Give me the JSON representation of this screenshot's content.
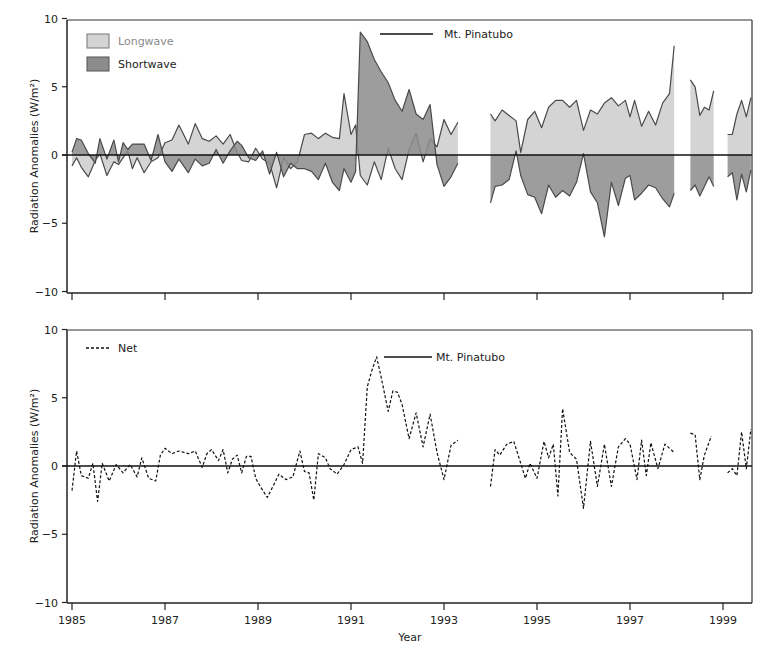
{
  "chart_data": [
    {
      "type": "area",
      "panel": "top",
      "title": "",
      "xlabel": "",
      "ylabel": "Radiation Anomalies (W/m²)",
      "ylim": [
        -10,
        10
      ],
      "yticks": [
        -10,
        -5,
        0,
        5,
        10
      ],
      "ytick_labels": [
        "−10",
        "−5",
        "0",
        "5",
        "10"
      ],
      "xlim": [
        1985,
        1999.7
      ],
      "xticks": [
        1985,
        1987,
        1989,
        1991,
        1993,
        1995,
        1997,
        1999
      ],
      "grid": false,
      "legend_position": "upper-left",
      "legend": [
        {
          "label": "Longwave",
          "color": "#d4d4d4"
        },
        {
          "label": "Shortwave",
          "color": "#8c8c8c"
        }
      ],
      "annotations": [
        {
          "text": "Mt. Pinatubo",
          "x": 1991.7,
          "y": 9.0
        }
      ],
      "series": [
        {
          "name": "Longwave",
          "color": "#d4d4d4",
          "segments": [
            {
              "x": [
                1985.0,
                1985.1,
                1985.2,
                1985.35,
                1985.5,
                1985.6,
                1985.75,
                1985.9,
                1986.0,
                1986.1,
                1986.2,
                1986.3,
                1986.4,
                1986.55,
                1986.7,
                1986.85,
                1987.0,
                1987.15,
                1987.3,
                1987.5,
                1987.65,
                1987.8,
                1987.95,
                1988.1,
                1988.25,
                1988.4,
                1988.55,
                1988.65,
                1988.8,
                1988.95,
                1989.1,
                1989.25,
                1989.4,
                1989.55,
                1989.7,
                1989.85,
                1990.0,
                1990.15,
                1990.3,
                1990.45,
                1990.6,
                1990.75,
                1990.85,
                1991.0,
                1991.1,
                1991.2,
                1991.35,
                1991.5,
                1991.65,
                1991.8,
                1991.95,
                1992.1,
                1992.25,
                1992.4,
                1992.55,
                1992.7,
                1992.85,
                1993.0,
                1993.15,
                1993.3
              ],
              "y": [
                -0.8,
                -0.2,
                -0.9,
                -1.6,
                -0.4,
                0.1,
                -1.5,
                -0.5,
                -0.7,
                -0.2,
                0.3,
                -1.0,
                -0.2,
                -1.3,
                -0.5,
                -0.2,
                0.9,
                1.1,
                2.2,
                0.8,
                2.3,
                1.2,
                1.0,
                1.4,
                0.8,
                1.5,
                0.2,
                -0.4,
                -0.5,
                0.5,
                -0.3,
                -0.6,
                -2.4,
                -0.2,
                -1.0,
                -0.5,
                1.5,
                1.6,
                1.2,
                1.6,
                1.3,
                1.2,
                4.5,
                1.5,
                2.2,
                -1.5,
                -2.2,
                -0.5,
                -1.8,
                0.5,
                -1.0,
                -1.8,
                0.4,
                1.6,
                -0.5,
                1.2,
                0.6,
                2.6,
                1.5,
                2.4
              ]
            },
            {
              "x": [
                1994.0,
                1994.1,
                1994.25,
                1994.4,
                1994.55,
                1994.65,
                1994.8,
                1994.95,
                1995.1,
                1995.25,
                1995.4,
                1995.55,
                1995.7,
                1995.85,
                1996.0,
                1996.15,
                1996.3,
                1996.45,
                1996.6,
                1996.75,
                1996.9,
                1997.0,
                1997.1,
                1997.25,
                1997.4,
                1997.55,
                1997.7,
                1997.85,
                1997.95
              ],
              "y": [
                3.0,
                2.5,
                3.3,
                2.9,
                2.5,
                0.2,
                2.6,
                3.2,
                2.0,
                3.5,
                4.0,
                4.0,
                3.5,
                4.0,
                1.8,
                3.3,
                3.0,
                3.8,
                4.2,
                3.6,
                4.0,
                2.8,
                4.0,
                2.1,
                3.2,
                2.2,
                3.8,
                4.5,
                8.0
              ]
            },
            {
              "x": [
                1998.3,
                1998.4,
                1998.5,
                1998.6,
                1998.7,
                1998.8
              ],
              "y": [
                5.5,
                5.0,
                2.9,
                3.5,
                3.3,
                4.7
              ]
            },
            {
              "x": [
                1999.1,
                1999.2,
                1999.3,
                1999.4,
                1999.5,
                1999.6
              ],
              "y": [
                1.5,
                1.5,
                3.0,
                4.0,
                2.8,
                4.2
              ]
            }
          ]
        },
        {
          "name": "Shortwave",
          "color": "#8c8c8c",
          "segments": [
            {
              "x": [
                1985.0,
                1985.1,
                1985.2,
                1985.35,
                1985.5,
                1985.6,
                1985.75,
                1985.9,
                1986.0,
                1986.1,
                1986.2,
                1986.3,
                1986.4,
                1986.55,
                1986.7,
                1986.85,
                1987.0,
                1987.15,
                1987.3,
                1987.5,
                1987.65,
                1987.8,
                1987.95,
                1988.1,
                1988.25,
                1988.4,
                1988.55,
                1988.65,
                1988.8,
                1988.95,
                1989.1,
                1989.25,
                1989.4,
                1989.55,
                1989.7,
                1989.85,
                1990.0,
                1990.15,
                1990.3,
                1990.45,
                1990.6,
                1990.75,
                1990.85,
                1991.0,
                1991.1,
                1991.2,
                1991.35,
                1991.5,
                1991.65,
                1991.8,
                1991.95,
                1992.1,
                1992.25,
                1992.4,
                1992.55,
                1992.7,
                1992.85,
                1993.0,
                1993.15,
                1993.3
              ],
              "y": [
                0.2,
                1.2,
                1.1,
                0.1,
                -0.6,
                1.2,
                -0.3,
                1.1,
                -0.5,
                0.9,
                0.4,
                0.8,
                0.8,
                0.8,
                -0.4,
                1.5,
                -0.5,
                -1.2,
                -0.3,
                -1.3,
                -0.3,
                -0.8,
                -0.6,
                0.4,
                -0.6,
                0.3,
                1.0,
                0.7,
                -0.2,
                -0.4,
                0.3,
                -1.4,
                0.2,
                -1.6,
                -0.6,
                -1.0,
                -1.0,
                -1.2,
                -1.8,
                -0.6,
                -2.0,
                -2.6,
                -1.0,
                -2.0,
                -1.2,
                9.0,
                8.3,
                7.0,
                6.1,
                5.3,
                4.0,
                3.2,
                4.8,
                3.0,
                2.6,
                3.7,
                -0.7,
                -2.3,
                -1.6,
                -0.6
              ]
            },
            {
              "x": [
                1994.0,
                1994.1,
                1994.25,
                1994.4,
                1994.55,
                1994.65,
                1994.8,
                1994.95,
                1995.1,
                1995.25,
                1995.4,
                1995.55,
                1995.7,
                1995.85,
                1996.0,
                1996.15,
                1996.3,
                1996.45,
                1996.6,
                1996.75,
                1996.9,
                1997.0,
                1997.1,
                1997.25,
                1997.4,
                1997.55,
                1997.7,
                1997.85,
                1997.95
              ],
              "y": [
                -3.5,
                -2.3,
                -2.2,
                -1.8,
                0.3,
                -1.5,
                -2.9,
                -3.1,
                -4.3,
                -2.2,
                -3.1,
                -2.6,
                -3.0,
                -2.0,
                0.1,
                -2.7,
                -3.5,
                -6.0,
                -2.0,
                -3.7,
                -1.7,
                -1.5,
                -3.3,
                -2.8,
                -2.2,
                -2.4,
                -3.2,
                -3.8,
                -2.8
              ]
            },
            {
              "x": [
                1998.3,
                1998.4,
                1998.5,
                1998.6,
                1998.7,
                1998.8
              ],
              "y": [
                -2.6,
                -2.2,
                -3.0,
                -2.3,
                -1.6,
                -2.3
              ]
            },
            {
              "x": [
                1999.1,
                1999.2,
                1999.3,
                1999.4,
                1999.5,
                1999.6
              ],
              "y": [
                -1.6,
                -1.3,
                -3.3,
                -1.4,
                -2.7,
                -1.1
              ]
            }
          ]
        }
      ]
    },
    {
      "type": "line",
      "panel": "bottom",
      "title": "",
      "xlabel": "Year",
      "ylabel": "Radiation Anomalies (W/m²)",
      "ylim": [
        -10,
        10
      ],
      "yticks": [
        -10,
        -5,
        0,
        5,
        10
      ],
      "ytick_labels": [
        "−10",
        "−5",
        "0",
        "5",
        "10"
      ],
      "xlim": [
        1985,
        1999.7
      ],
      "xticks": [
        1985,
        1987,
        1989,
        1991,
        1993,
        1995,
        1997,
        1999
      ],
      "xtick_labels": [
        "1985",
        "1987",
        "1989",
        "1991",
        "1993",
        "1995",
        "1997",
        "1999"
      ],
      "grid": false,
      "legend_position": "upper-left",
      "legend": [
        {
          "label": "Net",
          "style": "dashed",
          "color": "#111111"
        }
      ],
      "annotations": [
        {
          "text": "Mt. Pinatubo",
          "x": 1991.7,
          "y": 8.0
        }
      ],
      "series": [
        {
          "name": "Net",
          "style": "dashed",
          "segments": [
            {
              "x": [
                1985.0,
                1985.1,
                1985.2,
                1985.35,
                1985.45,
                1985.55,
                1985.65,
                1985.8,
                1985.95,
                1986.1,
                1986.25,
                1986.4,
                1986.5,
                1986.65,
                1986.8,
                1986.9,
                1987.0,
                1987.15,
                1987.3,
                1987.5,
                1987.65,
                1987.8,
                1987.9,
                1988.0,
                1988.15,
                1988.25,
                1988.35,
                1988.45,
                1988.55,
                1988.65,
                1988.75,
                1988.85,
                1988.95,
                1989.05,
                1989.2,
                1989.35,
                1989.45,
                1989.6,
                1989.75,
                1989.9,
                1990.0,
                1990.1,
                1990.2,
                1990.3,
                1990.45,
                1990.55,
                1990.7,
                1990.85,
                1991.0,
                1991.15,
                1991.25,
                1991.35,
                1991.45,
                1991.55,
                1991.65,
                1991.8,
                1991.9,
                1992.0,
                1992.1,
                1992.25,
                1992.4,
                1992.55,
                1992.7,
                1992.85,
                1993.0,
                1993.15,
                1993.3
              ],
              "y": [
                -1.8,
                1.1,
                -0.7,
                -0.9,
                0.2,
                -2.6,
                0.2,
                -1.1,
                0.1,
                -0.5,
                0.1,
                -0.8,
                0.6,
                -0.9,
                -1.1,
                0.8,
                1.3,
                0.9,
                1.1,
                0.9,
                1.1,
                -0.1,
                0.9,
                1.2,
                0.4,
                1.2,
                -0.5,
                0.5,
                0.8,
                -0.5,
                0.7,
                0.7,
                -0.9,
                -1.5,
                -2.3,
                -1.3,
                -0.6,
                -1.0,
                -0.8,
                1.1,
                -0.4,
                -0.5,
                -2.5,
                0.9,
                0.6,
                -0.2,
                -0.6,
                0.1,
                1.2,
                1.4,
                0.2,
                5.8,
                7.0,
                8.0,
                6.5,
                4.0,
                5.5,
                5.4,
                4.5,
                2.0,
                3.9,
                1.4,
                3.8,
                1.0,
                -1.0,
                1.5,
                1.9
              ]
            },
            {
              "x": [
                1994.0,
                1994.1,
                1994.2,
                1994.35,
                1994.5,
                1994.65,
                1994.75,
                1994.85,
                1995.0,
                1995.15,
                1995.25,
                1995.35,
                1995.45,
                1995.55,
                1995.7,
                1995.85,
                1996.0,
                1996.15,
                1996.3,
                1996.45,
                1996.6,
                1996.75,
                1996.9,
                1997.0,
                1997.15,
                1997.25,
                1997.35,
                1997.45,
                1997.6,
                1997.75,
                1997.95
              ],
              "y": [
                -1.5,
                1.2,
                0.8,
                1.6,
                1.8,
                0.2,
                -0.9,
                0.2,
                -0.9,
                1.8,
                0.6,
                1.6,
                -2.2,
                4.2,
                1.0,
                0.5,
                -3.1,
                1.8,
                -1.5,
                1.6,
                -1.5,
                1.4,
                2.0,
                1.6,
                -1.0,
                1.9,
                -0.7,
                1.7,
                -0.2,
                1.6,
                1.0
              ]
            },
            {
              "x": [
                1998.3,
                1998.4,
                1998.5,
                1998.6,
                1998.75
              ],
              "y": [
                2.4,
                2.3,
                -1.0,
                0.8,
                2.2
              ]
            },
            {
              "x": [
                1999.1,
                1999.2,
                1999.3,
                1999.4,
                1999.5,
                1999.6
              ],
              "y": [
                -0.5,
                -0.2,
                -0.7,
                2.5,
                -0.2,
                2.7
              ]
            }
          ]
        }
      ]
    }
  ],
  "figure": {
    "top_panel": {
      "ylabel": "Radiation Anomalies (W/m²)",
      "legend": {
        "longwave": "Longwave",
        "shortwave": "Shortwave"
      },
      "annotation": "Mt. Pinatubo",
      "yticks": [
        "10",
        "5",
        "0",
        "−5",
        "−10"
      ]
    },
    "bottom_panel": {
      "ylabel": "Radiation Anomalies (W/m²)",
      "legend": {
        "net": "Net"
      },
      "annotation": "Mt. Pinatubo",
      "yticks": [
        "10",
        "5",
        "0",
        "−5",
        "−10"
      ],
      "xticks": [
        "1985",
        "1987",
        "1989",
        "1991",
        "1993",
        "1995",
        "1997",
        "1999"
      ],
      "xlabel": "Year"
    },
    "colors": {
      "longwave": "#d4d4d4",
      "shortwave": "#8c8c8c",
      "line": "#4a4a4a",
      "axis": "#222222"
    }
  }
}
